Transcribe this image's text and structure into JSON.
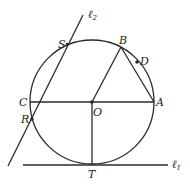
{
  "diagram": {
    "type": "geometry",
    "colors": {
      "stroke": "#2a2a2a",
      "text": "#222222",
      "background": "#ffffff"
    },
    "circle": {
      "center": "O",
      "cx": 92,
      "cy": 102,
      "r": 62
    },
    "points": {
      "S": {
        "label": "S",
        "x": 67,
        "y": 44
      },
      "B": {
        "label": "B",
        "x": 121,
        "y": 47
      },
      "D": {
        "label": "D",
        "x": 137,
        "y": 62
      },
      "C": {
        "label": "C",
        "x": 30,
        "y": 102
      },
      "O": {
        "label": "O",
        "x": 92,
        "y": 102
      },
      "A": {
        "label": "A",
        "x": 154,
        "y": 102
      },
      "R": {
        "label": "R",
        "x": 32,
        "y": 119
      },
      "T": {
        "label": "T",
        "x": 92,
        "y": 164
      }
    },
    "lines": {
      "l1": {
        "label": "ℓ",
        "subscript": "1",
        "x1": 23,
        "y1": 165,
        "x2": 168,
        "y2": 165
      },
      "l2": {
        "label": "ℓ",
        "subscript": "2",
        "x1": 8,
        "y1": 166,
        "x2": 83,
        "y2": 15
      }
    },
    "segments": [
      {
        "from": "C",
        "to": "A"
      },
      {
        "from": "O",
        "to": "B"
      },
      {
        "from": "B",
        "to": "A"
      },
      {
        "from": "O",
        "to": "T"
      }
    ]
  }
}
